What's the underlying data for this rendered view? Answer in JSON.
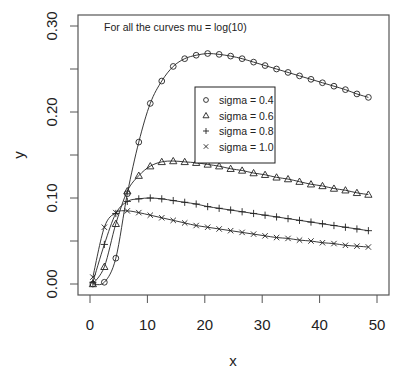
{
  "chart_data": {
    "type": "line",
    "title": "",
    "annotation": "For all the curves mu = log(10)",
    "xlabel": "x",
    "ylabel": "y",
    "xlim": [
      -2,
      52
    ],
    "ylim": [
      -0.01,
      0.31
    ],
    "x_ticks": [
      0,
      10,
      20,
      30,
      40,
      50
    ],
    "x_tick_labels": [
      "0",
      "10",
      "20",
      "30",
      "40",
      "50"
    ],
    "y_ticks": [
      0,
      0.05,
      0.1,
      0.15,
      0.2,
      0.25,
      0.3
    ],
    "y_tick_labels": [
      "0.00",
      "",
      "0.10",
      "",
      "0.20",
      "",
      "0.30"
    ],
    "grid": false,
    "legend_position": "center-inside",
    "x": [
      0.5,
      2.5,
      4.5,
      6.5,
      8.5,
      10.5,
      12.5,
      14.5,
      16.5,
      18.5,
      20.5,
      22.5,
      24.5,
      26.5,
      28.5,
      30.5,
      32.5,
      34.5,
      36.5,
      38.5,
      40.5,
      42.5,
      44.5,
      46.5,
      48.5
    ],
    "series": [
      {
        "name": "sigma = 0.4",
        "marker": "circle",
        "values": [
          0.0,
          0.002,
          0.03,
          0.105,
          0.165,
          0.21,
          0.236,
          0.253,
          0.262,
          0.266,
          0.268,
          0.267,
          0.265,
          0.262,
          0.258,
          0.254,
          0.25,
          0.246,
          0.242,
          0.238,
          0.234,
          0.23,
          0.226,
          0.221,
          0.217
        ]
      },
      {
        "name": "sigma = 0.6",
        "marker": "triangle",
        "values": [
          0.0,
          0.02,
          0.07,
          0.108,
          0.126,
          0.137,
          0.142,
          0.143,
          0.142,
          0.141,
          0.139,
          0.137,
          0.134,
          0.132,
          0.129,
          0.127,
          0.124,
          0.122,
          0.119,
          0.116,
          0.114,
          0.111,
          0.109,
          0.106,
          0.104
        ]
      },
      {
        "name": "sigma = 0.8",
        "marker": "plus",
        "values": [
          0.002,
          0.046,
          0.082,
          0.096,
          0.099,
          0.1,
          0.099,
          0.097,
          0.095,
          0.093,
          0.09,
          0.088,
          0.086,
          0.084,
          0.082,
          0.08,
          0.078,
          0.076,
          0.074,
          0.072,
          0.07,
          0.068,
          0.066,
          0.064,
          0.062
        ]
      },
      {
        "name": "sigma = 1.0",
        "marker": "cross",
        "values": [
          0.008,
          0.066,
          0.083,
          0.085,
          0.083,
          0.08,
          0.077,
          0.074,
          0.071,
          0.068,
          0.066,
          0.064,
          0.062,
          0.06,
          0.058,
          0.056,
          0.054,
          0.053,
          0.051,
          0.05,
          0.048,
          0.047,
          0.045,
          0.044,
          0.043
        ]
      }
    ]
  },
  "layout": {
    "plot": {
      "left": 78,
      "right": 389,
      "top": 15,
      "bottom": 295
    },
    "x_px": {
      "origin": 90,
      "per_unit": 5.74
    },
    "y_px": {
      "origin": 284,
      "per_unit": 860
    },
    "legend_box": {
      "x": 195,
      "y": 87,
      "w": 80,
      "h": 76
    },
    "colors": {
      "ink": "#222222",
      "frame": "#555555",
      "background": "#ffffff"
    }
  }
}
